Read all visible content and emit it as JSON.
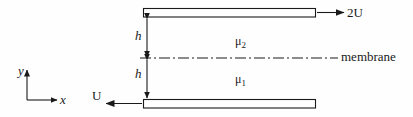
{
  "figure": {
    "background_color": "#fefefe",
    "line_color": "#1a1a1a",
    "labels": {
      "top_plate_velocity": "2U",
      "bottom_plate_velocity": "U",
      "membrane": "membrane",
      "upper_viscosity_symbol": "μ",
      "upper_viscosity_subscript": "2",
      "lower_viscosity_symbol": "μ",
      "lower_viscosity_subscript": "1",
      "gap_upper": "h",
      "gap_lower": "h",
      "axis_y": "y",
      "axis_x": "x"
    },
    "geometry": {
      "top_plate": {
        "x": 143,
        "y": 8,
        "width": 173,
        "height": 9
      },
      "bottom_plate": {
        "x": 143,
        "y": 99,
        "width": 173,
        "height": 9
      },
      "membrane_line_y": 58,
      "membrane_line_x_start": 140,
      "membrane_line_x_end": 338,
      "dimension_line_x": 147,
      "top_arrow": {
        "x_start": 317,
        "x_end": 344,
        "y": 12
      },
      "bottom_arrow": {
        "x_start": 142,
        "x_end": 106,
        "y": 103
      },
      "axis_origin": {
        "x": 27,
        "y": 100
      },
      "axis_y_tip": {
        "x": 27,
        "y": 70
      },
      "axis_x_tip": {
        "x": 57,
        "y": 100
      }
    }
  }
}
